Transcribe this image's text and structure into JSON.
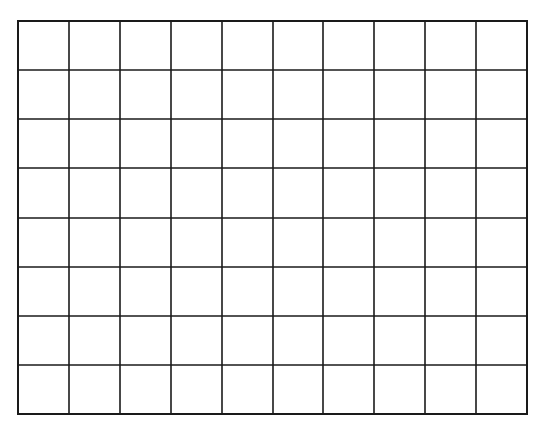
{
  "grid": {
    "columns": 10,
    "rows": 8,
    "left": 17,
    "top": 20,
    "width": 511,
    "height": 395,
    "line_color": "#1a1a1a",
    "background": "#ffffff"
  }
}
